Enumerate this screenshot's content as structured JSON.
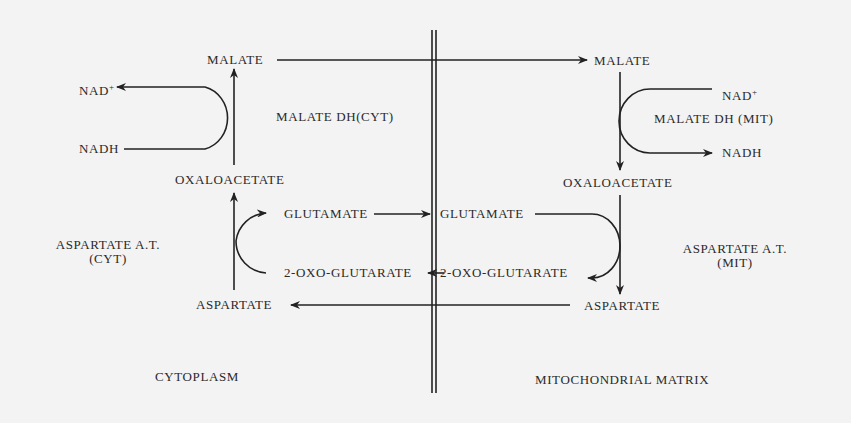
{
  "compartments": {
    "left": "CYTOPLASM",
    "right": "MITOCHONDRIAL MATRIX"
  },
  "cytoplasm": {
    "malate": "MALATE",
    "oxaloacetate": "OXALOACETATE",
    "aspartate": "ASPARTATE",
    "glutamate": "GLUTAMATE",
    "oxoglutarate": "2-OXO-GLUTARATE",
    "nad": "NAD",
    "nad_sup": "+",
    "nadh": "NADH",
    "enzyme_mdh": "MALATE DH(CYT)",
    "enzyme_ast_line1": "ASPARTATE A.T.",
    "enzyme_ast_line2": "(CYT)"
  },
  "mitochondria": {
    "malate": "MALATE",
    "oxaloacetate": "OXALOACETATE",
    "aspartate": "ASPARTATE",
    "glutamate": "GLUTAMATE",
    "oxoglutarate": "2-OXO-GLUTARATE",
    "nad": "NAD",
    "nad_sup": "+",
    "nadh": "NADH",
    "enzyme_mdh": "MALATE DH (MIT)",
    "enzyme_ast_line1": "ASPARTATE A.T.",
    "enzyme_ast_line2": "(MIT)"
  }
}
